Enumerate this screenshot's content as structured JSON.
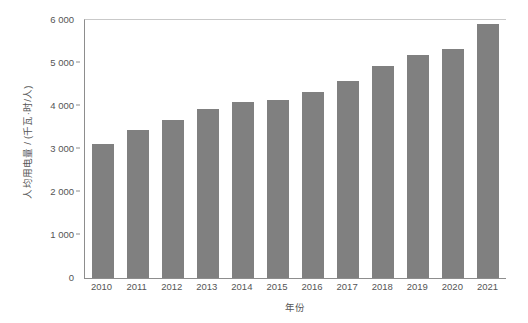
{
  "chart_data": {
    "type": "bar",
    "title": "",
    "subtitle": "",
    "xlabel": "年份",
    "ylabel": "人均用电量 / (千瓦·时/人)",
    "categories": [
      "2010",
      "2011",
      "2012",
      "2013",
      "2014",
      "2015",
      "2016",
      "2017",
      "2018",
      "2019",
      "2020",
      "2021"
    ],
    "values": [
      3120,
      3450,
      3670,
      3930,
      4100,
      4140,
      4320,
      4580,
      4940,
      5180,
      5320,
      5900
    ],
    "series": [
      {
        "name": "人均用电量",
        "values": [
          3120,
          3450,
          3670,
          3930,
          4100,
          4140,
          4320,
          4580,
          4940,
          5180,
          5320,
          5900
        ]
      }
    ],
    "ylim": [
      0,
      6000
    ],
    "ytick_values": [
      0,
      1000,
      2000,
      3000,
      4000,
      5000,
      6000
    ],
    "ytick_labels": [
      "0",
      "1 000",
      "2 000",
      "3 000",
      "4 000",
      "5 000",
      "6 000"
    ],
    "xtick_labels": [
      "2010",
      "2011",
      "2012",
      "2013",
      "2014",
      "2015",
      "2016",
      "2017",
      "2018",
      "2019",
      "2020",
      "2021"
    ],
    "grid": false,
    "legend": false,
    "legend_position": "none",
    "bar_color": "#808080",
    "axis_color": "#8d8d8d",
    "text_color": "#555555",
    "background_color": "#ffffff",
    "annotations": []
  }
}
